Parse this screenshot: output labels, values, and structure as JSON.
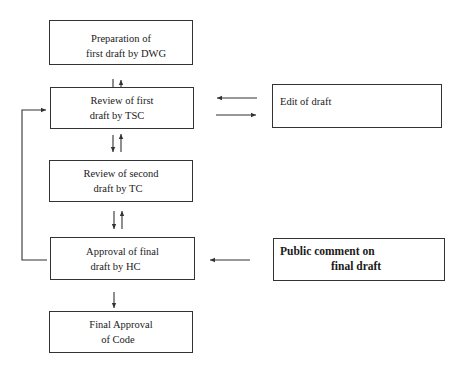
{
  "diagram": {
    "type": "flowchart",
    "nodes": [
      {
        "id": "prep",
        "lines": [
          "Preparation of",
          "first draft by DWG"
        ]
      },
      {
        "id": "review1",
        "lines": [
          "Review of first",
          "draft by TSC"
        ]
      },
      {
        "id": "review2",
        "lines": [
          "Review of second",
          "draft by TC"
        ]
      },
      {
        "id": "approval",
        "lines": [
          "Approval of final",
          "draft by HC"
        ]
      },
      {
        "id": "final",
        "lines": [
          "Final Approval",
          "of Code"
        ]
      },
      {
        "id": "edit",
        "lines": [
          "Edit of draft"
        ]
      },
      {
        "id": "public",
        "lines": [
          "Public comment on",
          "final draft"
        ]
      }
    ],
    "edges": [
      {
        "from": "prep",
        "to": "review1",
        "bidirectional": true
      },
      {
        "from": "review1",
        "to": "review2",
        "bidirectional": true
      },
      {
        "from": "review2",
        "to": "approval",
        "bidirectional": true
      },
      {
        "from": "approval",
        "to": "final",
        "bidirectional": false
      },
      {
        "from": "review1",
        "to": "edit",
        "bidirectional": true
      },
      {
        "from": "public",
        "to": "approval",
        "bidirectional": false
      },
      {
        "from": "approval",
        "to": "review1",
        "bidirectional": false,
        "route": "left loop"
      }
    ],
    "line_color": "#333333"
  }
}
